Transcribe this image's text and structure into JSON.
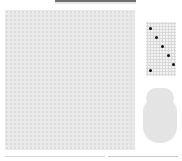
{
  "header": {
    "title_bar_color": "#6f6f6f"
  },
  "board": {
    "kind": "hex-grid",
    "fill_color": "#e9e9e9"
  },
  "side_panel": {
    "mini_grid": {
      "kind": "hex-grid",
      "pieces": [
        {
          "x": 4,
          "y": 6
        },
        {
          "x": 10,
          "y": 15
        },
        {
          "x": 16,
          "y": 24
        },
        {
          "x": 22,
          "y": 33
        },
        {
          "x": 27,
          "y": 42
        },
        {
          "x": 4,
          "y": 48
        }
      ],
      "piece_color": "#111111"
    },
    "jar": {
      "fill_color": "#e4e4e4"
    }
  },
  "status_bar": {
    "segments": 2
  }
}
